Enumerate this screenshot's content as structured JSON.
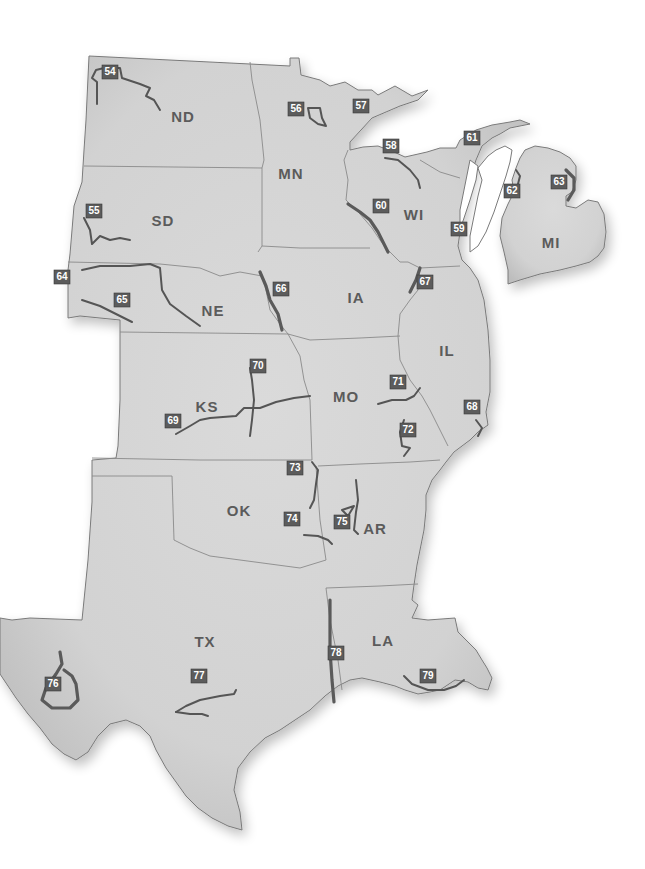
{
  "map": {
    "region": "Central United States",
    "colors": {
      "land": "#d4d4d4",
      "border": "#7a7a7a",
      "river": "#555555",
      "marker": "#5c5c5c",
      "marker_text": "#ffffff",
      "label": "#5b5b5b",
      "water": "#ffffff"
    },
    "states": [
      {
        "abbr": "ND",
        "x": 183,
        "y": 118
      },
      {
        "abbr": "MN",
        "x": 291,
        "y": 175
      },
      {
        "abbr": "WI",
        "x": 414,
        "y": 216
      },
      {
        "abbr": "MI",
        "x": 551,
        "y": 244
      },
      {
        "abbr": "SD",
        "x": 163,
        "y": 222
      },
      {
        "abbr": "IA",
        "x": 356,
        "y": 299
      },
      {
        "abbr": "NE",
        "x": 213,
        "y": 312
      },
      {
        "abbr": "IL",
        "x": 447,
        "y": 352
      },
      {
        "abbr": "KS",
        "x": 207,
        "y": 408
      },
      {
        "abbr": "MO",
        "x": 346,
        "y": 398
      },
      {
        "abbr": "OK",
        "x": 239,
        "y": 512
      },
      {
        "abbr": "AR",
        "x": 375,
        "y": 530
      },
      {
        "abbr": "TX",
        "x": 205,
        "y": 643
      },
      {
        "abbr": "LA",
        "x": 383,
        "y": 642
      }
    ],
    "markers": [
      {
        "id": "54",
        "x": 110,
        "y": 72
      },
      {
        "id": "55",
        "x": 94,
        "y": 211
      },
      {
        "id": "56",
        "x": 296,
        "y": 109
      },
      {
        "id": "57",
        "x": 361,
        "y": 106
      },
      {
        "id": "58",
        "x": 391,
        "y": 146
      },
      {
        "id": "59",
        "x": 459,
        "y": 229
      },
      {
        "id": "60",
        "x": 381,
        "y": 206
      },
      {
        "id": "61",
        "x": 472,
        "y": 138
      },
      {
        "id": "62",
        "x": 512,
        "y": 191
      },
      {
        "id": "63",
        "x": 559,
        "y": 182
      },
      {
        "id": "64",
        "x": 62,
        "y": 277
      },
      {
        "id": "65",
        "x": 122,
        "y": 300
      },
      {
        "id": "66",
        "x": 281,
        "y": 289
      },
      {
        "id": "67",
        "x": 425,
        "y": 282
      },
      {
        "id": "68",
        "x": 472,
        "y": 407
      },
      {
        "id": "69",
        "x": 173,
        "y": 421
      },
      {
        "id": "70",
        "x": 258,
        "y": 366
      },
      {
        "id": "71",
        "x": 398,
        "y": 382
      },
      {
        "id": "72",
        "x": 408,
        "y": 430
      },
      {
        "id": "73",
        "x": 295,
        "y": 468
      },
      {
        "id": "74",
        "x": 292,
        "y": 519
      },
      {
        "id": "75",
        "x": 342,
        "y": 522
      },
      {
        "id": "76",
        "x": 53,
        "y": 684
      },
      {
        "id": "77",
        "x": 199,
        "y": 676
      },
      {
        "id": "78",
        "x": 336,
        "y": 653
      },
      {
        "id": "79",
        "x": 428,
        "y": 676
      }
    ]
  }
}
